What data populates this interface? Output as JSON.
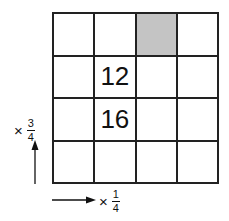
{
  "grid": {
    "rows": 4,
    "columns": 4,
    "cells": [
      [
        "",
        "",
        "",
        ""
      ],
      [
        "",
        "12",
        "",
        ""
      ],
      [
        "",
        "16",
        "",
        ""
      ],
      [
        "",
        "",
        "",
        ""
      ]
    ],
    "shaded_cell": {
      "row": 0,
      "col": 2
    },
    "shade_color": "#c4c4c4"
  },
  "vertical_label": {
    "operator": "×",
    "numerator": "3",
    "denominator": "4",
    "arrow_direction": "up"
  },
  "horizontal_label": {
    "operator": "×",
    "numerator": "1",
    "denominator": "4",
    "arrow_direction": "right"
  }
}
